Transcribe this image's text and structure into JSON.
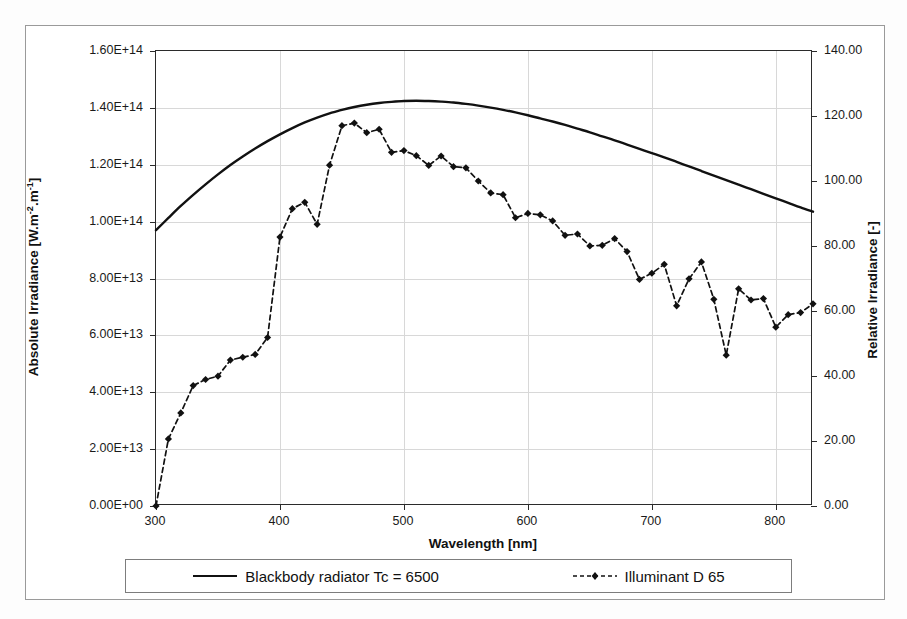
{
  "figure": {
    "background": "#ffffff",
    "frame_color": "#9a9a9a"
  },
  "axes": {
    "y_left": {
      "title": "Absolute Irradiance [W.m",
      "title_sup1": "-2",
      "title_mid": ".m",
      "title_sup2": "-1",
      "title_end": "]",
      "ticks": [
        "0.00E+00",
        "2.00E+13",
        "4.00E+13",
        "6.00E+13",
        "8.00E+13",
        "1.00E+14",
        "1.20E+14",
        "1.40E+14",
        "1.60E+14"
      ],
      "min": 0,
      "max": 160000000000000.0
    },
    "y_right": {
      "title": "Relative Irradiance [-]",
      "ticks": [
        "0.00",
        "20.00",
        "40.00",
        "60.00",
        "80.00",
        "100.00",
        "120.00",
        "140.00"
      ],
      "min": 0,
      "max": 140
    },
    "x": {
      "title": "Wavelength [nm]",
      "ticks": [
        "300",
        "400",
        "500",
        "600",
        "700",
        "800"
      ],
      "min": 300,
      "max": 830
    }
  },
  "legend": {
    "items": [
      {
        "label": "Blackbody radiator Tc = 6500",
        "style": "solid",
        "color": "#111111",
        "marker": "none"
      },
      {
        "label": "Illuminant D 65",
        "style": "dashed",
        "color": "#111111",
        "marker": "diamond"
      }
    ]
  },
  "chart_data": {
    "type": "line",
    "title": "",
    "xlabel": "Wavelength [nm]",
    "ylabel": "Absolute Irradiance [W.m-2.m-1]",
    "ylabel_secondary": "Relative Irradiance [-]",
    "xlim": [
      300,
      830
    ],
    "ylim": [
      0,
      160000000000000.0
    ],
    "ylim_secondary": [
      0,
      140
    ],
    "grid": true,
    "legend_position": "bottom",
    "series": [
      {
        "name": "Blackbody radiator Tc = 6500",
        "axis": "left",
        "style": "solid",
        "marker": "none",
        "x": [
          300,
          310,
          320,
          330,
          340,
          350,
          360,
          370,
          380,
          390,
          400,
          410,
          420,
          430,
          440,
          445,
          450,
          460,
          470,
          480,
          490,
          500,
          510,
          520,
          530,
          540,
          550,
          560,
          570,
          580,
          590,
          600,
          610,
          620,
          630,
          640,
          650,
          660,
          670,
          680,
          690,
          700,
          710,
          720,
          730,
          740,
          750,
          760,
          770,
          780,
          790,
          800,
          810,
          820,
          830
        ],
        "y": [
          97000000000000.0,
          101300000000000.0,
          105500000000000.0,
          109400000000000.0,
          113100000000000.0,
          116600000000000.0,
          119900000000000.0,
          122900000000000.0,
          125700000000000.0,
          128300000000000.0,
          130700000000000.0,
          132900000000000.0,
          134900000000000.0,
          136600000000000.0,
          138100000000000.0,
          138700000000000.0,
          139300000000000.0,
          140300000000000.0,
          141100000000000.0,
          141700000000000.0,
          142100000000000.0,
          142400000000000.0,
          142500000000000.0,
          142400000000000.0,
          142200000000000.0,
          141900000000000.0,
          141400000000000.0,
          140800000000000.0,
          140100000000000.0,
          139300000000000.0,
          138400000000000.0,
          137400000000000.0,
          136300000000000.0,
          135200000000000.0,
          134000000000000.0,
          132700000000000.0,
          131400000000000.0,
          130000000000000.0,
          128600000000000.0,
          127100000000000.0,
          125600000000000.0,
          124100000000000.0,
          122600000000000.0,
          121000000000000.0,
          119400000000000.0,
          117800000000000.0,
          116200000000000.0,
          114600000000000.0,
          113000000000000.0,
          111400000000000.0,
          109800000000000.0,
          108200000000000.0,
          106600000000000.0,
          105000000000000.0,
          103500000000000.0
        ]
      },
      {
        "name": "Illuminant D 65",
        "axis": "right",
        "style": "dashed",
        "marker": "diamond",
        "x": [
          300,
          310,
          320,
          330,
          340,
          350,
          360,
          370,
          380,
          390,
          400,
          410,
          420,
          430,
          440,
          450,
          460,
          470,
          480,
          490,
          500,
          510,
          520,
          530,
          540,
          550,
          560,
          570,
          580,
          590,
          600,
          610,
          620,
          630,
          640,
          650,
          660,
          670,
          680,
          690,
          700,
          710,
          720,
          730,
          740,
          750,
          760,
          770,
          780,
          790,
          800,
          810,
          820,
          830
        ],
        "y": [
          0.03,
          20.64,
          28.65,
          37.05,
          38.93,
          39.95,
          44.91,
          45.77,
          46.64,
          51.84,
          82.75,
          91.49,
          93.43,
          86.68,
          104.87,
          117.01,
          117.81,
          114.86,
          115.92,
          108.81,
          109.35,
          107.8,
          104.79,
          107.69,
          104.41,
          104.05,
          100.0,
          96.33,
          95.79,
          88.69,
          90.01,
          89.6,
          87.7,
          83.29,
          83.7,
          80.03,
          80.21,
          82.28,
          78.28,
          69.72,
          71.61,
          74.35,
          61.6,
          69.89,
          75.09,
          63.59,
          46.42,
          66.81,
          63.38,
          63.83,
          55.01,
          58.87,
          59.53,
          62.2
        ]
      }
    ]
  }
}
